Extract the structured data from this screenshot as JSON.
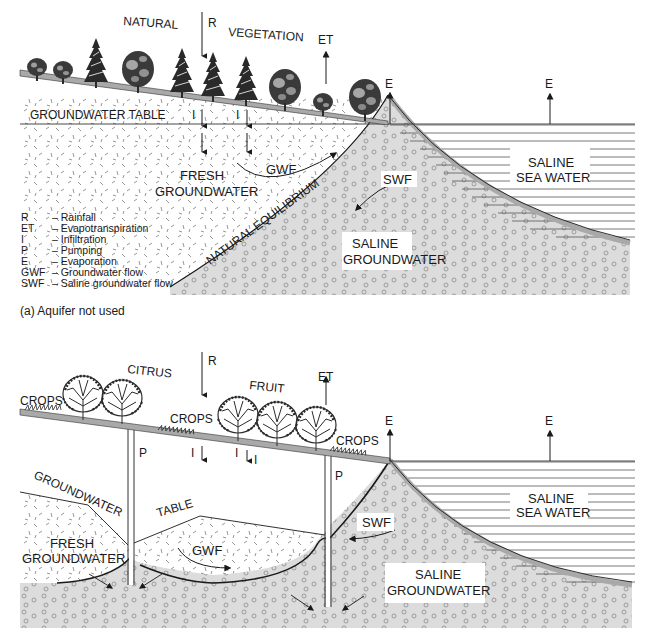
{
  "figure": {
    "panel_a": {
      "caption": "(a)  Aquifer not used",
      "labels": {
        "natural": "NATURAL",
        "vegetation": "VEGETATION",
        "rainfall": "R",
        "evapotranspiration": "ET",
        "evaporation_shore": "E",
        "evaporation_sea": "E",
        "groundwater_table": "GROUNDWATER TABLE",
        "infiltration_1": "I",
        "infiltration_2": "I",
        "fresh_groundwater_1": "FRESH",
        "fresh_groundwater_2": "GROUNDWATER",
        "gwf": "GWF",
        "swf": "SWF",
        "natural_equilibrium": "NATURAL EQUILIBRIUM",
        "saline_groundwater_1": "SALINE",
        "saline_groundwater_2": "GROUNDWATER",
        "sea_water_1": "SALINE",
        "sea_water_2": "SEA WATER"
      },
      "legend": [
        {
          "abbr": "R",
          "desc": "– Rainfall"
        },
        {
          "abbr": "ET",
          "desc": "– Evapotranspiration"
        },
        {
          "abbr": "I",
          "desc": "– Infiltration"
        },
        {
          "abbr": "P",
          "desc": "– Pumping"
        },
        {
          "abbr": "E",
          "desc": "– Evaporation"
        },
        {
          "abbr": "GWF",
          "desc": "– Groundwater flow"
        },
        {
          "abbr": "SWF",
          "desc": "– Saline groundwater flow"
        }
      ]
    },
    "panel_b": {
      "labels": {
        "crops_left": "CROPS",
        "citrus": "CITRUS",
        "rainfall": "R",
        "crops_mid": "CROPS",
        "fruit": "FRUIT",
        "evapotranspiration": "ET",
        "crops_right": "CROPS",
        "evaporation_shore": "E",
        "evaporation_sea": "E",
        "pump_1": "P",
        "pump_2": "P",
        "infiltration_1": "I",
        "infiltration_2": "I",
        "infiltration_3": "I",
        "groundwater": "GROUNDWATER",
        "table": "TABLE",
        "fresh_groundwater_1": "FRESH",
        "fresh_groundwater_2": "GROUNDWATER",
        "gwf": "GWF",
        "swf": "SWF",
        "saline_groundwater_1": "SALINE",
        "saline_groundwater_2": "GROUNDWATER",
        "sea_water_1": "SALINE",
        "sea_water_2": "SEA WATER"
      }
    },
    "colors": {
      "ground_strip": "#a9a9a9",
      "saline_fill": "#dcdcdc",
      "line": "#1a1a1a",
      "dash_marks": "#888888",
      "circle_marks": "#8a8a8a"
    }
  }
}
